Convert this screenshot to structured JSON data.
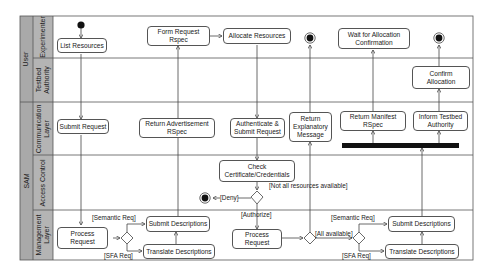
{
  "diagram": {
    "type": "uml-activity-diagram",
    "groups": [
      {
        "label": "User",
        "lanes": [
          "Experimenter",
          "Testbed Authority"
        ]
      },
      {
        "label": "SAM",
        "lanes": [
          "Communication Layer",
          "Access Control",
          "Management Layer"
        ]
      }
    ],
    "lanes": {
      "experimenter": "Experimenter",
      "testbed_authority": "Testbed\nAuthority",
      "communication": "Communication\nLayer",
      "access_control": "Access Control",
      "management": "Management\nLayer"
    },
    "actions": {
      "list_resources": "List Resources",
      "form_request_rspec": "Form Request\nRspec",
      "allocate_resources": "Allocate Resources",
      "wait_for_allocation": "Wait for Allocation\nConfirmation",
      "confirm_allocation": "Confirm\nAllocation",
      "submit_request": "Submit Request",
      "return_advertisement": "Return Advertisement\nRSpec",
      "authenticate_submit": "Authenticate &\nSubmit Request",
      "return_explanatory": "Return\nExplanatory\nMessage",
      "return_manifest": "Return Manifest\nRSpec",
      "inform_testbed": "Inform Testbed\nAuthority",
      "check_certificate": "Check\nCertificate/Credentials",
      "process_request_1": "Process\nRequest",
      "submit_descriptions_1": "Submit Descriptions",
      "translate_descriptions_1": "Translate Descriptions",
      "process_request_2": "Process\nRequest",
      "submit_descriptions_2": "Submit Descriptions",
      "translate_descriptions_2": "Translate Descriptions"
    },
    "guards": {
      "semantic_req_1": "[Semantic Req]",
      "sfa_req_1": "[SFA Req]",
      "deny": "[Deny]",
      "not_all_available": "[Not all resources available]",
      "authorize": "[Authorize]",
      "all_available": "[All available]",
      "semantic_req_2": "[Semantic Req]",
      "sfa_req_2": "[SFA Req]"
    },
    "colors": {
      "lane_header": "#a9a9a9",
      "border": "#555555",
      "fork_bar": "#111111"
    }
  }
}
